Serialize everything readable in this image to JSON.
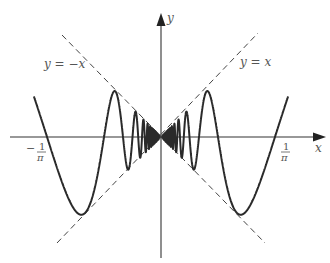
{
  "figure": {
    "function": "y = x sin(1/x)",
    "origin_px": [
      161,
      137
    ],
    "scale_px_per_unit": 358,
    "domain": [
      -0.355,
      0.355
    ],
    "colors": {
      "curve": "#2a2a2a",
      "axes": "#333333",
      "asymptote": "#444444",
      "text": "#555555"
    }
  },
  "axes": {
    "x_label": "x",
    "y_label": "y"
  },
  "lines": {
    "neg_label": "y = −x",
    "pos_label": "y = x"
  },
  "ticks": {
    "neg_one_over_pi": {
      "sign": "−",
      "num": "1",
      "den": "π"
    },
    "pos_one_over_pi": {
      "num": "1",
      "den": "π"
    }
  }
}
